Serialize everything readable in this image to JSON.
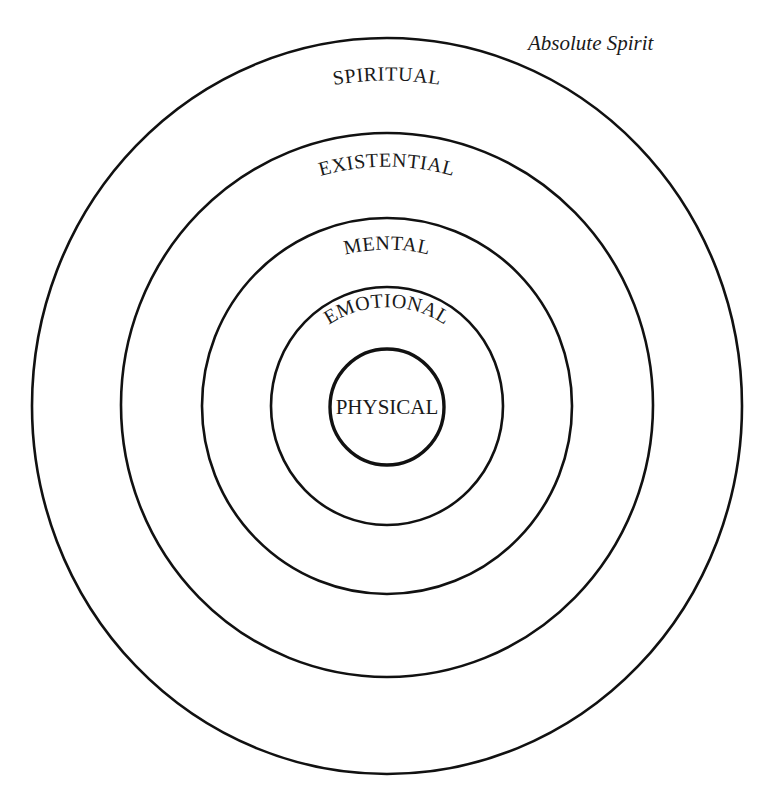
{
  "diagram": {
    "title": "Absolute Spirit",
    "levels": [
      {
        "label": "SPIRITUAL",
        "order": 5
      },
      {
        "label": "EXISTENTIAL",
        "order": 4
      },
      {
        "label": "MENTAL",
        "order": 3
      },
      {
        "label": "EMOTIONAL",
        "order": 2
      },
      {
        "label": "PHYSICAL",
        "order": 1
      }
    ],
    "stroke_color": "#111111",
    "background_color": "#ffffff"
  }
}
